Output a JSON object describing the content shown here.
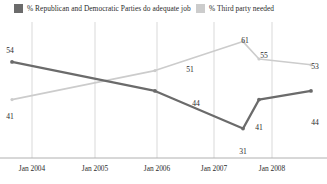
{
  "legend": {
    "items": [
      {
        "label": "% Republican and Democratic Parties do adequate job",
        "color": "#6b6b6b",
        "swatch_icon": "legend-swatch-square"
      },
      {
        "label": "% Third party needed",
        "color": "#cccccc",
        "swatch_icon": "legend-swatch-square"
      }
    ]
  },
  "chart_data": {
    "type": "line",
    "title": "",
    "subtitle": "",
    "xlabel": "",
    "ylabel": "",
    "grid": "vertical",
    "legend_position": "top",
    "ylim": [
      25,
      65
    ],
    "xlim": [
      0,
      7
    ],
    "categories": [
      "Jan 2004",
      "Jan 2005",
      "Jan 2006",
      "Jan 2007",
      "Jan 2008"
    ],
    "tick_labels": [
      "Jan 2004",
      "Jan 2005",
      "Jan 2006",
      "Jan 2007",
      "Jan 2008"
    ],
    "series": [
      {
        "name": "% Republican and Democratic Parties do adequate job",
        "color": "#6b6b6b",
        "values": [
          54,
          44,
          31,
          41,
          44
        ],
        "labels": [
          "54",
          "44",
          "31",
          "41",
          "44"
        ]
      },
      {
        "name": "% Third party needed",
        "color": "#cccccc",
        "values": [
          41,
          51,
          61,
          55,
          53
        ],
        "labels": [
          "41",
          "51",
          "61",
          "55",
          "53"
        ]
      }
    ],
    "annotations": []
  },
  "point_labels": {
    "primary": [
      {
        "text": "54",
        "x": 10,
        "y": 28
      },
      {
        "text": "44",
        "x": 196,
        "y": 81
      },
      {
        "text": "31",
        "x": 243,
        "y": 129
      },
      {
        "text": "41",
        "x": 259,
        "y": 105
      },
      {
        "text": "44",
        "x": 315,
        "y": 100
      }
    ],
    "secondary": [
      {
        "text": "41",
        "x": 10,
        "y": 94
      },
      {
        "text": "51",
        "x": 190,
        "y": 47
      },
      {
        "text": "61",
        "x": 245,
        "y": 18
      },
      {
        "text": "55",
        "x": 264,
        "y": 33
      },
      {
        "text": "53",
        "x": 315,
        "y": 44
      }
    ]
  },
  "axis": {
    "ticks": [
      {
        "label": "Jan 2004",
        "x": 32
      },
      {
        "label": "Jan 2005",
        "x": 95
      },
      {
        "label": "Jan 2006",
        "x": 157
      },
      {
        "label": "Jan 2007",
        "x": 214
      },
      {
        "label": "Jan 2008",
        "x": 272
      }
    ]
  },
  "colors": {
    "primary_series": "#6b6b6b",
    "secondary_series": "#cccccc",
    "gridline": "#d9d9d9",
    "axis": "#b0b0b0",
    "text": "#2b2b2b",
    "background": "#ffffff"
  }
}
